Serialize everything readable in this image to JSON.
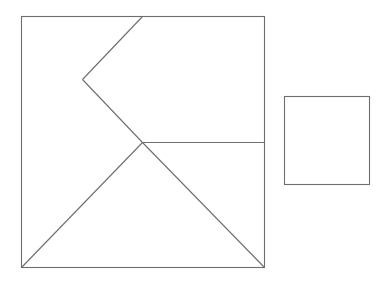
{
  "diagram": {
    "title": "",
    "stroke_color": "#6e6e6e",
    "background": "#ffffff",
    "stroke_width": 1.1,
    "large_square": {
      "x": 21,
      "y": 16,
      "width": 243,
      "height": 251
    },
    "inner_lines": [
      {
        "name": "chevron-upper-edge",
        "x1": 142,
        "y1": 16,
        "x2": 82,
        "y2": 79
      },
      {
        "name": "chevron-lower-edge",
        "x1": 82,
        "y1": 79,
        "x2": 142,
        "y2": 142
      },
      {
        "name": "horizontal-divider",
        "x1": 142,
        "y1": 142,
        "x2": 264,
        "y2": 142
      },
      {
        "name": "triangle-left-edge",
        "x1": 142,
        "y1": 142,
        "x2": 21,
        "y2": 267
      },
      {
        "name": "triangle-right-edge",
        "x1": 142,
        "y1": 142,
        "x2": 264,
        "y2": 267
      }
    ],
    "small_square": {
      "x": 284,
      "y": 96,
      "width": 85,
      "height": 88
    }
  }
}
